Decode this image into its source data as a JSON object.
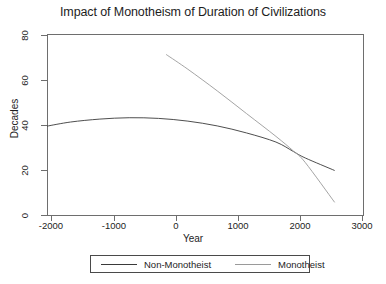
{
  "chart_data": {
    "type": "line",
    "title": "Impact of Monotheism of Duration of Civilizations",
    "xlabel": "Year",
    "ylabel": "Decades",
    "xlim": [
      -2400,
      3000
    ],
    "ylim": [
      0,
      80
    ],
    "xticks": [
      -2000,
      -1000,
      0,
      1000,
      2000,
      3000
    ],
    "xtick_labels": [
      "-2000",
      "-1000",
      "0",
      "1000",
      "2000",
      "3000"
    ],
    "yticks": [
      0,
      20,
      40,
      60,
      80
    ],
    "ytick_labels": [
      "0",
      "20",
      "40",
      "60",
      "80"
    ],
    "grid": false,
    "legend_position": "bottom-outside",
    "series": [
      {
        "name": "Non-Monotheist",
        "color": "#3a3a3a",
        "points": [
          {
            "x": -2400,
            "y": 39.5
          },
          {
            "x": -2000,
            "y": 41.3
          },
          {
            "x": -1500,
            "y": 42.6
          },
          {
            "x": -1000,
            "y": 43.2
          },
          {
            "x": -500,
            "y": 42.9
          },
          {
            "x": 0,
            "y": 41.7
          },
          {
            "x": 500,
            "y": 39.6
          },
          {
            "x": 1000,
            "y": 36.5
          },
          {
            "x": 1500,
            "y": 32.5
          },
          {
            "x": 1800,
            "y": 28.3
          },
          {
            "x": 2000,
            "y": 25.5
          },
          {
            "x": 2500,
            "y": 20.0
          }
        ]
      },
      {
        "name": "Monotheist",
        "color": "#9a9a9a",
        "points": [
          {
            "x": -370,
            "y": 71.0
          },
          {
            "x": 0,
            "y": 64.5
          },
          {
            "x": 500,
            "y": 55.0
          },
          {
            "x": 1000,
            "y": 45.0
          },
          {
            "x": 1500,
            "y": 35.0
          },
          {
            "x": 1800,
            "y": 28.5
          },
          {
            "x": 2000,
            "y": 23.5
          },
          {
            "x": 2500,
            "y": 6.0
          }
        ]
      }
    ]
  },
  "legend": {
    "items": [
      {
        "label": "Non-Monotheist"
      },
      {
        "label": "Monotheist"
      }
    ]
  }
}
